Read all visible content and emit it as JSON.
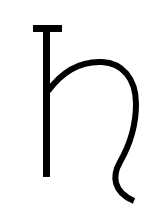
{
  "glyph": {
    "name": "saturn-symbol",
    "color": "#000000",
    "background": "#ffffff"
  }
}
